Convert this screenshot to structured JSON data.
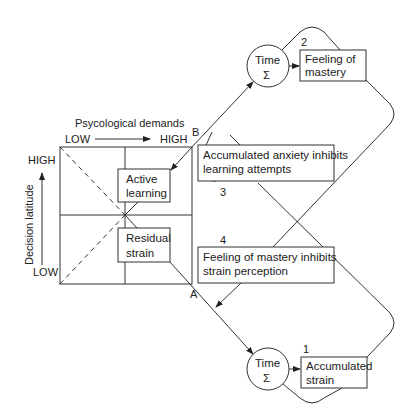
{
  "axes": {
    "x_title": "Psycological demands",
    "x_low": "LOW",
    "x_high": "HIGH",
    "y_title": "Decision latitude",
    "y_low": "LOW",
    "y_high": "HIGH"
  },
  "quadrant_boxes": {
    "active_learning": [
      "Active",
      "learning"
    ],
    "residual_strain": [
      "Residual",
      "strain"
    ]
  },
  "path_labels": {
    "b": "B",
    "a": "A"
  },
  "time_nodes": {
    "top": {
      "line1": "Time",
      "symbol": "Σ"
    },
    "bottom": {
      "line1": "Time",
      "symbol": "Σ"
    }
  },
  "outcome_boxes": {
    "mastery": {
      "number": "2",
      "lines": [
        "Feeling of",
        "mastery"
      ]
    },
    "strain": {
      "number": "1",
      "lines": [
        "Accumulated",
        "strain"
      ]
    }
  },
  "inhibition_boxes": {
    "anxiety": {
      "number": "3",
      "lines": [
        "Accumulated anxiety inhibits",
        "learning attempts"
      ]
    },
    "mastery": {
      "number": "4",
      "lines": [
        "Feeling of mastery inhibits",
        "strain perception"
      ]
    }
  }
}
